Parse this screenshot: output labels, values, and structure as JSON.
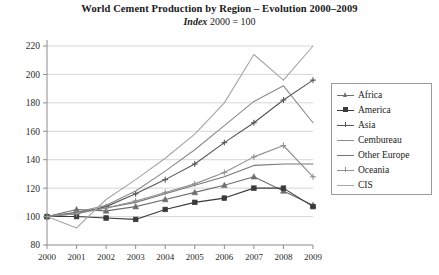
{
  "title": {
    "main": "World Cement Production by Region – Evolution 2000–2009",
    "sub_italic": "Index",
    "sub_rest": " 2000 = 100"
  },
  "legend": {
    "position": "right",
    "entries": [
      {
        "label": "Africa",
        "color": "#6e6e6e",
        "marker": "triangle"
      },
      {
        "label": "America",
        "color": "#3a3a3a",
        "marker": "square"
      },
      {
        "label": "Asia",
        "color": "#555555",
        "marker": "plus"
      },
      {
        "label": "Cembureau",
        "color": "#8a8a8a",
        "marker": "none"
      },
      {
        "label": "Other Europe",
        "color": "#777777",
        "marker": "none"
      },
      {
        "label": "Oceania",
        "color": "#909090",
        "marker": "plus"
      },
      {
        "label": "CIS",
        "color": "#a6a6a6",
        "marker": "none"
      }
    ]
  },
  "chart_data": {
    "type": "line",
    "title": "World Cement Production by Region – Evolution 2000–2009",
    "subtitle": "Index 2000 = 100",
    "xlabel": "",
    "ylabel": "",
    "x": [
      2000,
      2001,
      2002,
      2003,
      2004,
      2005,
      2006,
      2007,
      2008,
      2009
    ],
    "xtick_labels": [
      "2000",
      "2001",
      "2002",
      "2003",
      "2004",
      "2005",
      "2006",
      "2007",
      "2008",
      "2009"
    ],
    "ytick_labels": [
      "80",
      "100",
      "120",
      "140",
      "160",
      "180",
      "200",
      "220"
    ],
    "ylim": [
      80,
      220
    ],
    "ytick_step": 20,
    "grid": true,
    "grid_axis": "y",
    "legend_position": "right",
    "series": [
      {
        "name": "Africa",
        "color": "#6e6e6e",
        "marker": "triangle",
        "values": [
          100,
          105,
          104,
          107,
          112,
          117,
          122,
          128,
          118,
          108
        ]
      },
      {
        "name": "America",
        "color": "#3a3a3a",
        "marker": "square",
        "values": [
          100,
          100,
          99,
          98,
          105,
          110,
          113,
          120,
          120,
          107
        ]
      },
      {
        "name": "Asia",
        "color": "#555555",
        "marker": "plus",
        "values": [
          100,
          102,
          107,
          116,
          126,
          137,
          152,
          166,
          182,
          196
        ]
      },
      {
        "name": "Cembureau",
        "color": "#8a8a8a",
        "marker": "none",
        "values": [
          100,
          103,
          108,
          118,
          132,
          147,
          164,
          181,
          192,
          166
        ]
      },
      {
        "name": "Other Europe",
        "color": "#777777",
        "marker": "none",
        "values": [
          100,
          103,
          106,
          110,
          116,
          122,
          128,
          136,
          137,
          137
        ]
      },
      {
        "name": "Oceania",
        "color": "#909090",
        "marker": "plus",
        "values": [
          100,
          102,
          106,
          111,
          117,
          123,
          131,
          142,
          150,
          128
        ]
      },
      {
        "name": "CIS",
        "color": "#a6a6a6",
        "marker": "none",
        "values": [
          100,
          92,
          112,
          126,
          141,
          158,
          180,
          214,
          196,
          220
        ]
      }
    ]
  },
  "axes": {
    "y_min": 80,
    "y_max": 220,
    "x_min": 2000,
    "x_max": 2009
  }
}
